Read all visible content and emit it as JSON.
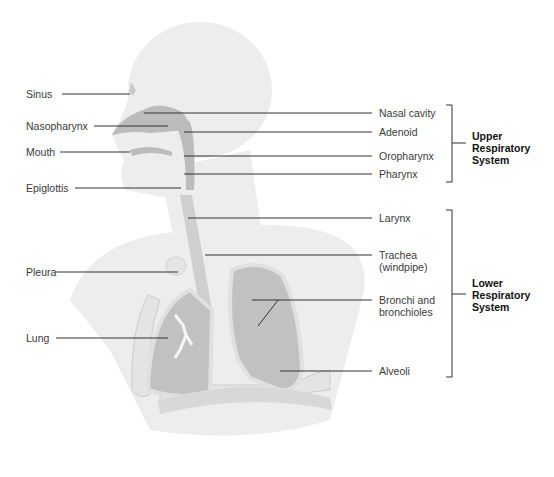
{
  "diagram": {
    "left_labels": [
      {
        "text": "Sinus",
        "x": 26,
        "y": 6
      },
      {
        "text": "Nasopharynx",
        "x": 26,
        "y": 120
      },
      {
        "text": "Mouth",
        "x": 26,
        "y": 146
      },
      {
        "text": "Epiglottis",
        "x": 26,
        "y": 182
      },
      {
        "text": "Pleura",
        "x": 26,
        "y": 264
      },
      {
        "text": "Lung",
        "x": 26,
        "y": 333
      }
    ],
    "right_labels": [
      {
        "text": "Nasal cavity",
        "x": 380,
        "y": 108
      },
      {
        "text": "Adenoid",
        "x": 380,
        "y": 127
      },
      {
        "text": "Oropharynx",
        "x": 380,
        "y": 151
      },
      {
        "text": "Pharynx",
        "x": 380,
        "y": 170
      },
      {
        "text": "Larynx",
        "x": 380,
        "y": 212
      },
      {
        "text": "Trachea",
        "x": 380,
        "y": 248
      },
      {
        "text": "(windpipe)",
        "x": 380,
        "y": 260
      },
      {
        "text": "Bronchi and",
        "x": 380,
        "y": 294
      },
      {
        "text": "bronchioles",
        "x": 380,
        "y": 306
      },
      {
        "text": "Alveoli",
        "x": 380,
        "y": 365
      }
    ],
    "groups": {
      "upper": {
        "line1": "Upper",
        "line2": "Respiratory",
        "line3": "System"
      },
      "lower": {
        "line1": "Lower",
        "line2": "Respiratory",
        "line3": "System"
      }
    },
    "sinus_label": "Sinus",
    "colors": {
      "body": "#ececec",
      "body_edge": "#e2e2e2",
      "airway": "#b9b9b9",
      "lung": "#bdbdbd",
      "lung_rim": "#dcdcdc",
      "leader_line": "#333333",
      "label_text": "#3a3a3a",
      "group_text": "#111111"
    }
  }
}
